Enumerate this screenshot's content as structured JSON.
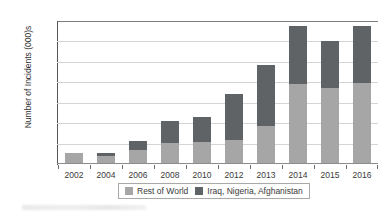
{
  "chart_data": {
    "type": "bar",
    "subtype": "stacked-vertical",
    "title": "",
    "xlabel": "",
    "ylabel": "Number of Incidents (000)s",
    "ylim": [
      0,
      14000
    ],
    "ytick_step": 2000,
    "yticks": [
      "0",
      "2000",
      "4000",
      "6000",
      "8000",
      "10000",
      "12000",
      "14000"
    ],
    "grid": "horizontal",
    "legend_position": "bottom",
    "categories": [
      "2002",
      "2004",
      "2006",
      "2008",
      "2010",
      "2012",
      "2013",
      "2014",
      "2015",
      "2016"
    ],
    "series": [
      {
        "name": "Rest of World",
        "color": "#a6a6a6",
        "values": [
          950,
          700,
          1250,
          2000,
          2050,
          2250,
          3600,
          7700,
          7300,
          7800
        ]
      },
      {
        "name": "Iraq, Nigeria, Afghanistan",
        "color": "#5f6365",
        "values": [
          0,
          250,
          900,
          2100,
          2450,
          4500,
          6000,
          5700,
          4650,
          5600
        ]
      }
    ],
    "totals": [
      950,
      950,
      2150,
      4100,
      4500,
      6750,
      9600,
      13400,
      11950,
      13400
    ]
  },
  "legend": {
    "items": [
      {
        "label": "Rest of World",
        "color": "#a6a6a6"
      },
      {
        "label": "Iraq, Nigeria, Afghanistan",
        "color": "#5f6365"
      }
    ]
  },
  "colors": {
    "rest_of_world": "#a6a6a6",
    "iraq_nigeria_afghanistan": "#5f6365",
    "gridline": "#d4d4d4",
    "axis": "#6d6d6d",
    "text": "#3a3a3a"
  }
}
